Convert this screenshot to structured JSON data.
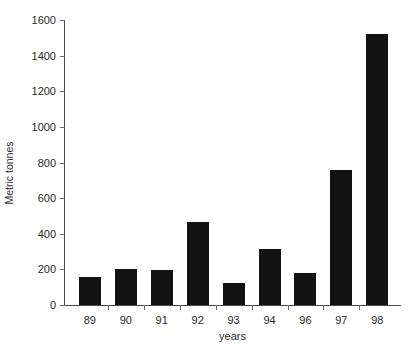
{
  "chart_data": {
    "type": "bar",
    "title": "",
    "subtitle": "",
    "xlabel": "years",
    "ylabel": "Metric tonnes",
    "categories": [
      "89",
      "90",
      "91",
      "92",
      "93",
      "94",
      "96",
      "97",
      "98"
    ],
    "values": [
      155,
      202,
      198,
      465,
      125,
      315,
      178,
      760,
      1520
    ],
    "series": [
      {
        "name": "Metric tonnes",
        "values": [
          155,
          202,
          198,
          465,
          125,
          315,
          178,
          760,
          1520
        ]
      }
    ],
    "ylim": [
      0,
      1600
    ],
    "yticks": [
      0,
      200,
      400,
      600,
      800,
      1000,
      1200,
      1400,
      1600
    ],
    "ytick_labels": [
      "0",
      "200",
      "400",
      "600",
      "800",
      "1000",
      "1200",
      "1400",
      "1600"
    ],
    "grid": false,
    "legend": false,
    "legend_position": "none",
    "bar_color": "#121212",
    "axis_color": "#4a4a4a",
    "background": "#ffffff",
    "annotations": []
  }
}
